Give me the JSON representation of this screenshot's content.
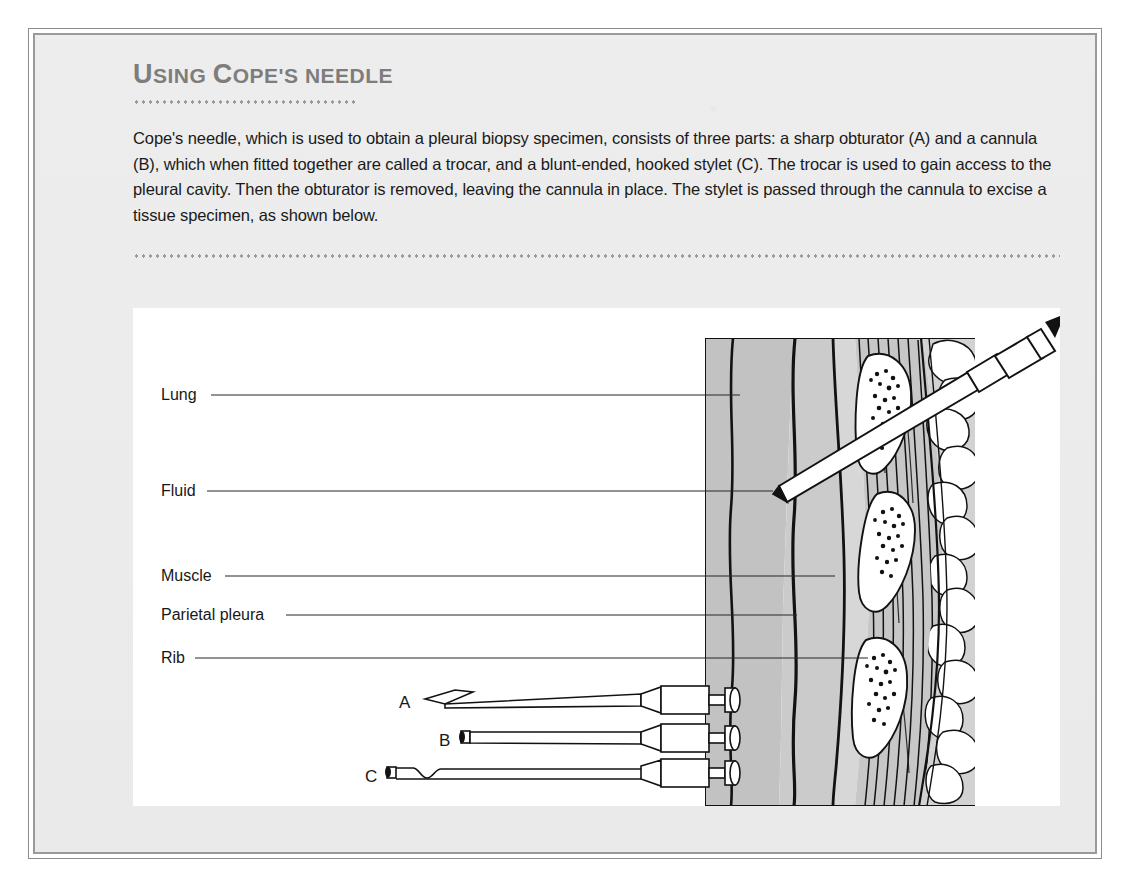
{
  "panel": {
    "title_full": "USING COPE'S NEEDLE",
    "title_parts": [
      {
        "text": "U",
        "style": "cap"
      },
      {
        "text": "SING",
        "style": "sc"
      },
      {
        "text": " ",
        "style": "sc"
      },
      {
        "text": "C",
        "style": "cap"
      },
      {
        "text": "OPE'S",
        "style": "sc"
      },
      {
        "text": " ",
        "style": "sc"
      },
      {
        "text": "NEEDLE",
        "style": "sc"
      }
    ],
    "body": "Cope's needle, which is used to obtain a pleural biopsy specimen, consists of three parts: a sharp obturator (A) and a cannula (B), which when fitted together are called a trocar, and a blunt-ended, hooked stylet (C). The trocar is used to gain access to the pleural cavity. Then the obturator is removed, leaving the cannula in place. The stylet is passed through the cannula to excise a tissue specimen, as shown below."
  },
  "colors": {
    "page_background": "#ededed",
    "frame_outer": "#8d8d8d",
    "frame_inner": "#9a9a9a",
    "title_text": "#7d7d7d",
    "body_text": "#1a1a1a",
    "dot_rule": "#9b9b9b",
    "illustration_background": "#ffffff",
    "lung_fill": "#bfbfbf",
    "fluid_fill": "#cfcfcf",
    "pleura_fill": "#d9d9d9",
    "muscle_fill": "#c9c9c9",
    "bone_fill": "#ffffff",
    "ink": "#121212"
  },
  "illustration": {
    "labels": [
      {
        "id": "lung",
        "text": "Lung",
        "text_x": 28,
        "text_y": 92,
        "line_x1": 78,
        "line_y1": 87,
        "line_x2": 607,
        "line_y2": 87
      },
      {
        "id": "fluid",
        "text": "Fluid",
        "text_x": 28,
        "text_y": 188,
        "line_x1": 74,
        "line_y1": 183,
        "line_x2": 640,
        "line_y2": 183
      },
      {
        "id": "muscle",
        "text": "Muscle",
        "text_x": 28,
        "text_y": 273,
        "line_x1": 92,
        "line_y1": 268,
        "line_x2": 702,
        "line_y2": 268
      },
      {
        "id": "parietal-pleura",
        "text": "Parietal pleura",
        "text_x": 28,
        "text_y": 312,
        "line_x1": 153,
        "line_y1": 307,
        "line_x2": 664,
        "line_y2": 307
      },
      {
        "id": "rib",
        "text": "Rib",
        "text_x": 28,
        "text_y": 355,
        "line_x1": 62,
        "line_y1": 350,
        "line_x2": 735,
        "line_y2": 350
      }
    ],
    "instruments": [
      {
        "id": "obturator",
        "letter": "A",
        "name": "sharp obturator",
        "letter_x": 272,
        "letter_y": 400,
        "tip": "beveled-sharp",
        "y": 392
      },
      {
        "id": "cannula",
        "letter": "B",
        "name": "cannula",
        "letter_x": 312,
        "letter_y": 438,
        "tip": "open-blunt",
        "y": 430
      },
      {
        "id": "stylet",
        "letter": "C",
        "name": "hooked stylet",
        "letter_x": 237,
        "letter_y": 474,
        "tip": "hooked-blunt",
        "y": 466
      }
    ],
    "needle_in_tissue": {
      "id": "inserted-needle",
      "arrow_direction": "up-right"
    }
  }
}
